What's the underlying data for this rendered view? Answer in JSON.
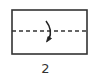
{
  "diagram": {
    "type": "origami-fold-step",
    "step_number": "2",
    "paper": {
      "shape": "rectangle",
      "x": 12,
      "y": 10,
      "width": 75,
      "height": 44,
      "stroke": "#333333"
    },
    "fold_line": {
      "style": "dashed",
      "orientation": "horizontal",
      "y": 31,
      "label": "valley fold"
    },
    "arrow": {
      "type": "curved-arrow",
      "direction": "down",
      "meaning": "fold top half down"
    },
    "colors": {
      "line": "#333333",
      "background": "#ffffff"
    }
  }
}
